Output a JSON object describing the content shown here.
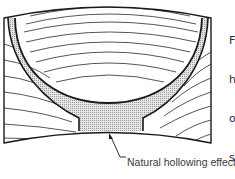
{
  "figure": {
    "label": "Natural hollowing effect",
    "colors": {
      "line": "#1a1a1a",
      "hatch_fill": "#d9d9d9",
      "background": "#ffffff"
    }
  },
  "side_text": {
    "lines": [
      "F",
      "h",
      "o",
      "s",
      "in",
      "b",
      "u"
    ]
  }
}
